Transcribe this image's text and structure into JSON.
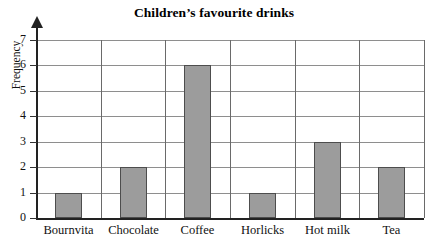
{
  "chart_data": {
    "type": "bar",
    "title": "Children’s favourite drinks",
    "xlabel": "",
    "ylabel": "Frequency",
    "categories": [
      "Bournvita",
      "Chocolate",
      "Coffee",
      "Horlicks",
      "Hot milk",
      "Tea"
    ],
    "values": [
      1,
      2,
      6,
      1,
      3,
      2
    ],
    "ylim": [
      0,
      7
    ],
    "ytick_labels": [
      "0",
      "1",
      "2",
      "3",
      "4",
      "5",
      "6",
      "7"
    ],
    "ytick_values": [
      0,
      1,
      2,
      3,
      4,
      5,
      6,
      7
    ],
    "grid": "horizontal-and-vertical",
    "legend": "none",
    "bar_fill_color": "#9c9c9c",
    "bar_border_color": "#4d4d4d",
    "gridline_color": "#8e8e8e",
    "axis_color": "#222222"
  }
}
